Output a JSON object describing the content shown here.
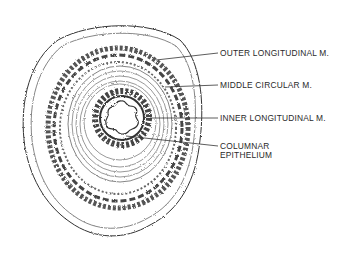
{
  "figure": {
    "labels": [
      {
        "id": "outer",
        "text": "OUTER LONGITUDINAL M."
      },
      {
        "id": "middle",
        "text": "MIDDLE CIRCULAR M."
      },
      {
        "id": "inner",
        "text": "INNER LONGITUDINAL M."
      },
      {
        "id": "columnar_1",
        "text": "COLUMNAR"
      },
      {
        "id": "columnar_2",
        "text": "EPITHELIUM"
      }
    ],
    "colors": {
      "ink": "#2a2a2a",
      "background": "#ffffff"
    }
  }
}
